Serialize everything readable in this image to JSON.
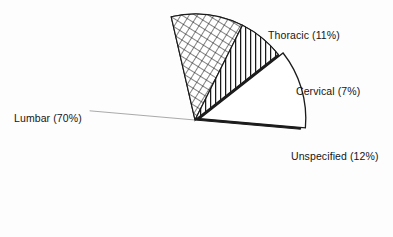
{
  "chart_data": {
    "type": "pie",
    "title": "",
    "subtitle": "",
    "xlabel": "",
    "ylabel": "",
    "legend_position": "none",
    "grid": false,
    "labels_inline": true,
    "categories": [
      "Lumbar",
      "Thoracic",
      "Cervical",
      "Unspecified"
    ],
    "values": [
      70,
      11,
      7,
      12
    ],
    "units": "percent",
    "slices": [
      {
        "name": "Lumbar",
        "label": "Lumbar (70%)",
        "value": 70,
        "fill": "solid-black",
        "color": "#1b1b1b",
        "exploded": false,
        "start_angle_deg": 103,
        "end_angle_deg": 355,
        "label_x": 14,
        "label_y": 113
      },
      {
        "name": "Thoracic",
        "label": "Thoracic (11%)",
        "value": 11,
        "fill": "cross-hatch",
        "color": "#ffffff",
        "exploded": false,
        "start_angle_deg": 103,
        "end_angle_deg": 63.4,
        "label_x": 268,
        "label_y": 30
      },
      {
        "name": "Cervical",
        "label": "Cervical (7%)",
        "value": 7,
        "fill": "vertical-lines",
        "color": "#ffffff",
        "exploded": false,
        "start_angle_deg": 63.4,
        "end_angle_deg": 38.2,
        "label_x": 296,
        "label_y": 86
      },
      {
        "name": "Unspecified",
        "label": "Unspecified (12%)",
        "value": 12,
        "fill": "white",
        "color": "#ffffff",
        "exploded": true,
        "start_angle_deg": 38.2,
        "end_angle_deg": -5,
        "label_x": 291,
        "label_y": 151
      }
    ],
    "geometry": {
      "center_x": 195,
      "center_y": 120,
      "radius": 106
    },
    "background_color": "#fdfdfd",
    "outline_color": "#1b1b1b"
  },
  "labels": {
    "thoracic": "Thoracic (11%)",
    "cervical": "Cervical (7%)",
    "unspecified": "Unspecified (12%)",
    "lumbar": "Lumbar (70%)"
  }
}
